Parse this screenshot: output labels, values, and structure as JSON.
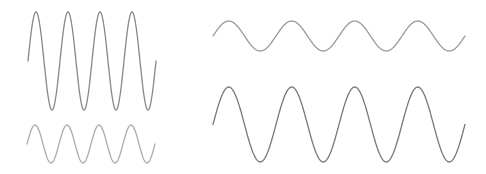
{
  "canvas": {
    "width": 486,
    "height": 174,
    "background": "#ffffff"
  },
  "waves": [
    {
      "id": "top-left",
      "x_start": 28,
      "x_end": 156,
      "center_y": 61,
      "amplitude": 49,
      "cycles": 4,
      "color": "#888888"
    },
    {
      "id": "bottom-left",
      "x_start": 27,
      "x_end": 155,
      "center_y": 144,
      "amplitude": 19,
      "cycles": 4,
      "color": "#aaaaaa"
    },
    {
      "id": "top-right",
      "x_start": 213,
      "x_end": 465,
      "center_y": 36,
      "amplitude": 15,
      "cycles": 4,
      "color": "#999999"
    },
    {
      "id": "bottom-right",
      "x_start": 213,
      "x_end": 465,
      "center_y": 124.5,
      "amplitude": 37.5,
      "cycles": 4,
      "color": "#777777"
    }
  ]
}
